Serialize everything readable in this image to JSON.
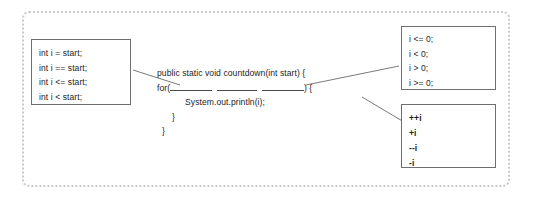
{
  "worksheet": {
    "title": "Java for-loop fill-in-the-blank exercise",
    "frame_color": "#c9c9c9",
    "box_border_color": "#6f6f6f",
    "text_color": "#1d1d1d",
    "connector_color": "#7a7a7a"
  },
  "options_initialization": {
    "label": "initialization options",
    "items": [
      "int i = start;",
      "int i == start;",
      "int i <= start;",
      "int i < start;"
    ]
  },
  "options_condition": {
    "label": "condition options",
    "items": [
      "i <= 0;",
      "i < 0;",
      "i > 0;",
      "i >= 0;"
    ]
  },
  "options_update": {
    "label": "update options",
    "items": [
      "++i",
      "+i",
      "--i",
      "-i"
    ]
  },
  "code": {
    "signature": "public static void countdown(int start) {",
    "for_keyword": "for(",
    "for_close": ") {",
    "body": "System.out.println(i);",
    "close_inner": "}",
    "close_outer": "}",
    "blank_1_label": "initialization-blank",
    "blank_2_label": "condition-blank",
    "blank_3_label": "update-blank"
  }
}
